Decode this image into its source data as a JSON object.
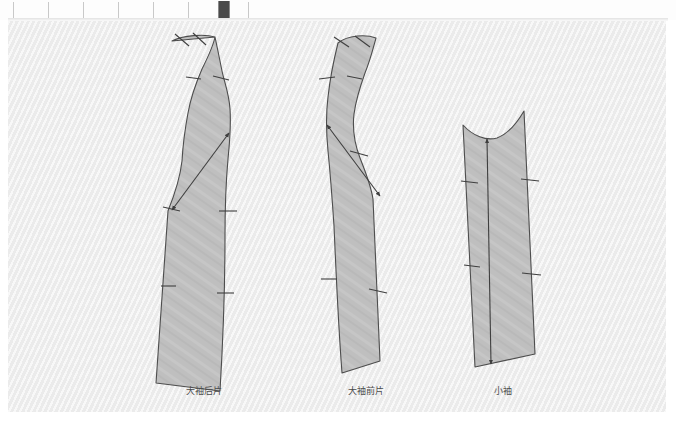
{
  "app": {
    "title": "Pattern Drafting Canvas",
    "background_color": "#f2f2f2",
    "piece_fill_color": "#bfbfbf",
    "piece_stroke_color": "#4d4d4d",
    "label_color": "#4c4c4c"
  },
  "ruler": {
    "name": "horizontal-ruler",
    "tick_positions_px": [
      13,
      48,
      83,
      118,
      153,
      188,
      223,
      248
    ],
    "marker": {
      "name": "ruler-position-marker",
      "x_px": 218,
      "width_px": 10,
      "color": "#4a4a4a"
    }
  },
  "pieces": [
    {
      "id": "upper-sleeve-back",
      "label": "大袖后片",
      "label_x": 196,
      "label_y": 365,
      "notch_count": 7,
      "has_diagonal_arrow_line": true,
      "arrow_direction": "down-left"
    },
    {
      "id": "upper-sleeve-front",
      "label": "大袖前片",
      "label_x": 358,
      "label_y": 365,
      "notch_count": 7,
      "has_diagonal_arrow_line": true,
      "arrow_direction": "down-right"
    },
    {
      "id": "under-sleeve",
      "label": "小袖",
      "label_x": 495,
      "label_y": 365,
      "notch_count": 2,
      "has_diagonal_arrow_line": false,
      "grainline": "vertical-double-arrow"
    }
  ]
}
